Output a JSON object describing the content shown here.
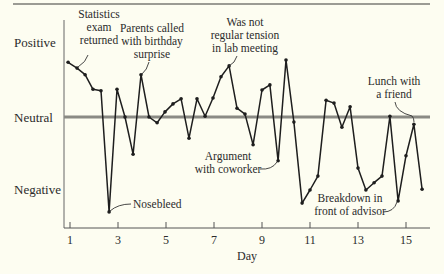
{
  "chart_data": {
    "type": "line",
    "title": "",
    "xlabel": "Day",
    "ylabel": "",
    "x_ticks": [
      1,
      3,
      5,
      7,
      9,
      11,
      13,
      15
    ],
    "y_tick_labels": [
      "Positive",
      "Neutral",
      "Negative"
    ],
    "xlim": [
      0.75,
      15.9
    ],
    "ylim": [
      -1.5,
      1.1
    ],
    "grid": false,
    "reference_line": {
      "label": "Neutral",
      "value": 0
    },
    "series": [
      {
        "name": "Mood",
        "x": [
          0.92,
          1.29,
          1.63,
          1.96,
          2.29,
          2.63,
          2.96,
          3.29,
          3.63,
          3.96,
          4.29,
          4.63,
          4.96,
          5.29,
          5.63,
          5.96,
          6.29,
          6.63,
          6.96,
          7.29,
          7.63,
          7.96,
          8.29,
          8.63,
          9.0,
          9.33,
          9.67,
          10.0,
          10.33,
          10.67,
          11.0,
          11.33,
          11.67,
          12.0,
          12.33,
          12.67,
          13.0,
          13.33,
          13.67,
          14.0,
          14.33,
          14.67,
          15.0,
          15.33,
          15.67
        ],
        "values": [
          0.75,
          0.67,
          0.58,
          0.38,
          0.36,
          -1.3,
          0.38,
          0.0,
          -0.51,
          0.58,
          0.0,
          -0.08,
          0.07,
          0.18,
          0.25,
          -0.29,
          0.25,
          0.01,
          0.26,
          0.55,
          0.7,
          0.12,
          0.04,
          -0.38,
          0.37,
          0.44,
          -0.6,
          0.78,
          -0.07,
          -1.18,
          -1.0,
          -0.81,
          0.23,
          0.19,
          -0.14,
          0.14,
          -0.7,
          -1.0,
          -0.9,
          -0.81,
          0.01,
          -1.15,
          -0.53,
          -0.1,
          -0.99
        ]
      }
    ],
    "annotations": [
      {
        "text": [
          "Statistics",
          "exam",
          "returned"
        ],
        "point_index": 1
      },
      {
        "text": [
          "Parents called",
          "with birthday",
          "surprise"
        ],
        "point_index": 9
      },
      {
        "text": [
          "Was not",
          "regular tension",
          "in lab meeting"
        ],
        "point_index": 20
      },
      {
        "text": [
          "Nosebleed"
        ],
        "point_index": 5
      },
      {
        "text": [
          "Argument",
          "with coworker"
        ],
        "point_index": 26
      },
      {
        "text": [
          "Breakdown in",
          "front of advisor"
        ],
        "point_index": 41
      },
      {
        "text": [
          "Lunch with",
          "a friend"
        ],
        "point_index": 43
      }
    ]
  },
  "labels": {
    "positive": "Positive",
    "neutral": "Neutral",
    "negative": "Negative",
    "xlabel": "Day",
    "ticks": [
      "1",
      "3",
      "5",
      "7",
      "9",
      "11",
      "13",
      "15"
    ]
  },
  "annotations": {
    "stats": [
      "Statistics",
      "exam",
      "returned"
    ],
    "parents": [
      "Parents called",
      "with birthday",
      "surprise"
    ],
    "tension": [
      "Was not",
      "regular tension",
      "in lab meeting"
    ],
    "nosebleed": "Nosebleed",
    "argument": [
      "Argument",
      "with coworker"
    ],
    "breakdown": [
      "Breakdown in",
      "front of advisor"
    ],
    "lunch": [
      "Lunch with",
      "a friend"
    ]
  },
  "colors": {
    "background": "#fdfdf1",
    "line": "#1e1e1e",
    "neutral_line": "#8a8a84",
    "axis": "#555555",
    "text": "#2b2b2b"
  }
}
